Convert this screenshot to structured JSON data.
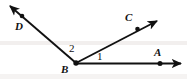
{
  "figure": {
    "background_color": "#ffffff",
    "stroke_color": "#111111",
    "width": 187,
    "height": 79,
    "vertex": {
      "name": "B",
      "x": 76,
      "y": 63
    },
    "rays": [
      {
        "name": "ray-BD",
        "label": "D",
        "from": {
          "x": 76,
          "y": 63
        },
        "to": {
          "x": 8,
          "y": 4
        },
        "point": {
          "x": 22,
          "y": 16
        },
        "label_position": {
          "x": 15,
          "y": 21
        },
        "arrow": "filled-triangle"
      },
      {
        "name": "ray-BC",
        "label": "C",
        "from": {
          "x": 76,
          "y": 63
        },
        "to": {
          "x": 159,
          "y": 19
        },
        "point": {
          "x": 137,
          "y": 29
        },
        "label_position": {
          "x": 125,
          "y": 12
        },
        "arrow": "filled-triangle"
      },
      {
        "name": "ray-BA",
        "label": "A",
        "from": {
          "x": 76,
          "y": 63
        },
        "to": {
          "x": 184,
          "y": 63
        },
        "point": {
          "x": 160,
          "y": 63
        },
        "label_position": {
          "x": 154,
          "y": 47
        },
        "arrow": "filled-triangle"
      }
    ],
    "angles": [
      {
        "name": "angle-1",
        "label": "1",
        "between": "ray-BA and ray-BC",
        "label_position": {
          "x": 97,
          "y": 51
        }
      },
      {
        "name": "angle-2",
        "label": "2",
        "between": "ray-BC and ray-BD",
        "label_position": {
          "x": 69,
          "y": 43
        }
      }
    ],
    "labels": {
      "point_A": "A",
      "point_B": "B",
      "point_C": "C",
      "point_D": "D",
      "angle_1": "1",
      "angle_2": "2"
    }
  }
}
